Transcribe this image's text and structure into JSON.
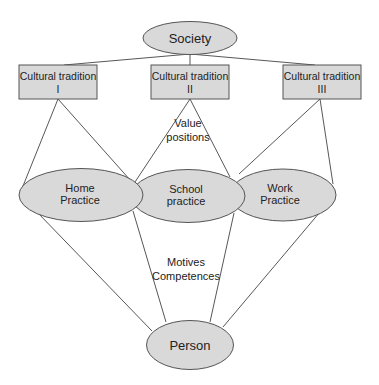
{
  "diagram": {
    "nodes": {
      "society": {
        "label": "Society"
      },
      "tradition_1": {
        "line1": "Cultural tradition",
        "line2": "I"
      },
      "tradition_2": {
        "line1": "Cultural tradition",
        "line2": "II"
      },
      "tradition_3": {
        "line1": "Cultural tradition",
        "line2": "III"
      },
      "home": {
        "line1": "Home",
        "line2": "Practice"
      },
      "school": {
        "line1": "School",
        "line2": "practice"
      },
      "work": {
        "line1": "Work",
        "line2": "Practice"
      },
      "person": {
        "label": "Person"
      }
    },
    "annotations": {
      "value_positions": {
        "line1": "Value",
        "line2": "positions"
      },
      "motives_competences": {
        "line1": "Motives",
        "line2": "Competences"
      }
    },
    "edges": [
      {
        "from": "society",
        "to": "tradition_1"
      },
      {
        "from": "society",
        "to": "tradition_2"
      },
      {
        "from": "society",
        "to": "tradition_3"
      },
      {
        "from": "tradition_1",
        "to": "home"
      },
      {
        "from": "tradition_1",
        "to": "home-school"
      },
      {
        "from": "tradition_2",
        "to": "home-school"
      },
      {
        "from": "tradition_2",
        "to": "school-work"
      },
      {
        "from": "tradition_3",
        "to": "school-work"
      },
      {
        "from": "tradition_3",
        "to": "work"
      },
      {
        "from": "home",
        "to": "person"
      },
      {
        "from": "home-school",
        "to": "person"
      },
      {
        "from": "school-work",
        "to": "person"
      },
      {
        "from": "work",
        "to": "person"
      }
    ],
    "colors": {
      "node_fill": "#d9d9d9",
      "stroke": "#555555"
    }
  }
}
